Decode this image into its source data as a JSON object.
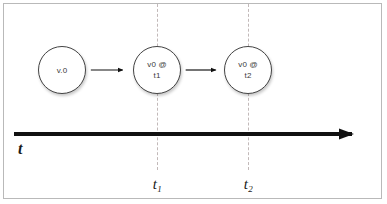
{
  "diagram": {
    "background_color": "#ffffff",
    "frame_color": "#b9b9b9",
    "nodes": [
      {
        "id": "v0",
        "line1": "v.0",
        "line2": "",
        "cx": 62,
        "cy": 70
      },
      {
        "id": "v0-t1",
        "line1": "v0 @",
        "line2": "t1",
        "cx": 157,
        "cy": 70
      },
      {
        "id": "v0-t2",
        "line1": "v0 @",
        "line2": "t2",
        "cx": 248,
        "cy": 70
      }
    ],
    "edges": [
      {
        "from": "v0",
        "to": "v0-t1",
        "label": ""
      },
      {
        "from": "v0-t1",
        "to": "v0-t2",
        "label": ""
      }
    ],
    "axis": {
      "label": "t",
      "color": "#111111",
      "x_start": 14,
      "x_end": 365,
      "y": 134
    },
    "guides": [
      {
        "x": 157,
        "label": "t",
        "subscript": "1"
      },
      {
        "x": 248,
        "label": "t",
        "subscript": "2"
      }
    ],
    "tick_labels": [
      {
        "base": "t",
        "sub": "1",
        "x": 157
      },
      {
        "base": "t",
        "sub": "2",
        "x": 248
      }
    ]
  }
}
